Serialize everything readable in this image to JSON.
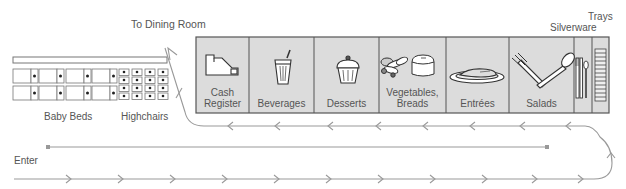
{
  "labels": {
    "dining_room": "To Dining Room",
    "baby_beds": "Baby Beds",
    "highchairs": "Highchairs",
    "enter": "Enter",
    "trays": "Trays",
    "silverware": "Silverware"
  },
  "stations": [
    {
      "id": "cash-register",
      "label_line1": "Cash",
      "label_line2": "Register",
      "icon": "cash-register-icon"
    },
    {
      "id": "beverages",
      "label_line1": "Beverages",
      "label_line2": "",
      "icon": "beverage-cup-icon"
    },
    {
      "id": "desserts",
      "label_line1": "Desserts",
      "label_line2": "",
      "icon": "cupcake-icon"
    },
    {
      "id": "vegetables-breads",
      "label_line1": "Vegetables,",
      "label_line2": "Breads",
      "icon": "vegetables-bread-icon"
    },
    {
      "id": "entrees",
      "label_line1": "Entrées",
      "label_line2": "",
      "icon": "entree-plate-icon"
    },
    {
      "id": "salads",
      "label_line1": "Salads",
      "label_line2": "",
      "icon": "fork-spoon-icon"
    }
  ],
  "colors": {
    "counter_fill": "#dcdcdc",
    "counter_stroke": "#555555",
    "path_stroke": "#999999",
    "icon_stroke": "#444444"
  }
}
